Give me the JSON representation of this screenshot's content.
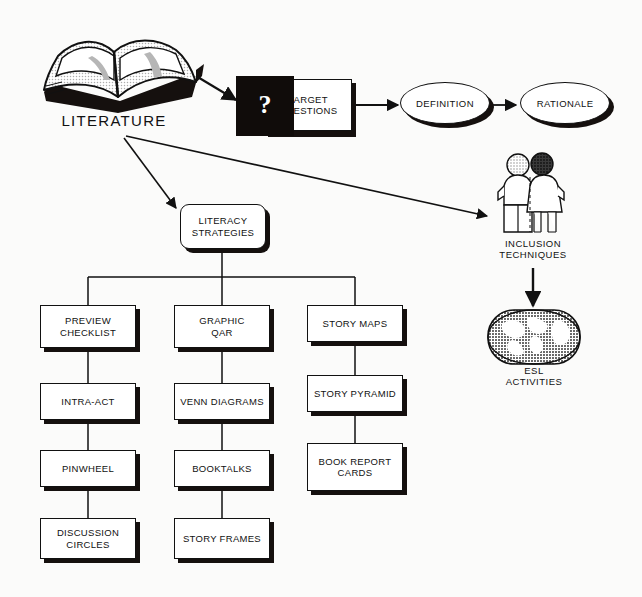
{
  "diagram": {
    "colors": {
      "ink": "#111111",
      "paper": "#fbfbfa",
      "shadow": "#15100e",
      "fill": "#ffffff"
    },
    "root": {
      "label": "LITERATURE",
      "icon": "open-book-icon"
    },
    "top_flow": {
      "question_mark": "?",
      "target_questions": "TARGET\nQUESTIONS",
      "target_questions_line1": "TARGET",
      "target_questions_line2": "QUESTIONS",
      "definition": "DEFINITION",
      "rationale": "RATIONALE"
    },
    "hub": {
      "line1": "LITERACY",
      "line2": "STRATEGIES"
    },
    "right_branch": {
      "inclusion_icon": "two-people-icon",
      "inclusion_line1": "INCLUSION",
      "inclusion_line2": "TECHNIQUES",
      "esl_icon": "globe-icon",
      "esl_line1": "ESL",
      "esl_line2": "ACTIVITIES"
    },
    "columns": [
      {
        "name": "column-1",
        "items": [
          {
            "line1": "PREVIEW",
            "line2": "CHECKLIST"
          },
          {
            "line1": "INTRA-ACT",
            "line2": ""
          },
          {
            "line1": "PINWHEEL",
            "line2": ""
          },
          {
            "line1": "DISCUSSION",
            "line2": "CIRCLES"
          }
        ]
      },
      {
        "name": "column-2",
        "items": [
          {
            "line1": "GRAPHIC",
            "line2": "QAR"
          },
          {
            "line1": "VENN DIAGRAMS",
            "line2": ""
          },
          {
            "line1": "BOOKTALKS",
            "line2": ""
          },
          {
            "line1": "STORY FRAMES",
            "line2": ""
          }
        ]
      },
      {
        "name": "column-3",
        "items": [
          {
            "line1": "STORY MAPS",
            "line2": ""
          },
          {
            "line1": "STORY PYRAMID",
            "line2": ""
          },
          {
            "line1": "BOOK REPORT",
            "line2": "CARDS"
          }
        ]
      }
    ]
  }
}
